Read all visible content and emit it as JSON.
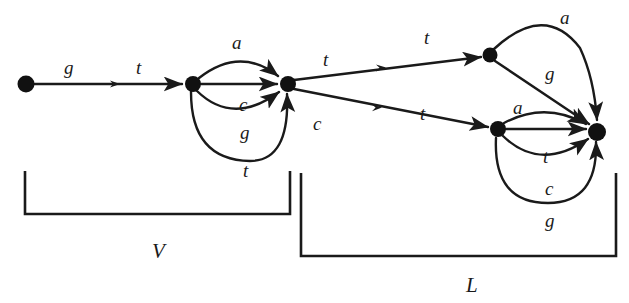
{
  "figure": {
    "type": "directed-graph",
    "alphabet": [
      "a",
      "c",
      "g",
      "t"
    ]
  },
  "nodes": [
    {
      "id": "n0",
      "x": 26,
      "y": 84,
      "r": 8.5
    },
    {
      "id": "n1",
      "x": 193,
      "y": 84,
      "r": 8.0
    },
    {
      "id": "n2",
      "x": 288,
      "y": 84,
      "r": 8.0
    },
    {
      "id": "n3",
      "x": 490,
      "y": 55,
      "r": 7.5
    },
    {
      "id": "n4",
      "x": 498,
      "y": 129,
      "r": 8.0
    },
    {
      "id": "n5",
      "x": 597,
      "y": 132,
      "r": 9.0
    }
  ],
  "edges": [
    {
      "id": "e0",
      "from": "n0",
      "to": "n1",
      "labels": [
        "g",
        "t"
      ]
    },
    {
      "id": "e1",
      "from": "n1",
      "to": "n2",
      "label": "a",
      "shape": "arc-up"
    },
    {
      "id": "e2",
      "from": "n1",
      "to": "n2",
      "label": "",
      "shape": "straight"
    },
    {
      "id": "e3",
      "from": "n1",
      "to": "n2",
      "label": "c",
      "shape": "arc-down-shallow"
    },
    {
      "id": "e4",
      "from": "n1",
      "to": "n2",
      "label": "g",
      "shape": "arc-down-deep"
    },
    {
      "id": "e5",
      "from": "n1",
      "to": "n2",
      "label": "t",
      "shape": "arc-down-deepest"
    },
    {
      "id": "e6",
      "from": "n2",
      "to": "n3",
      "label": "t",
      "shape": "fork-up"
    },
    {
      "id": "e7",
      "from": "n2",
      "to": "n4",
      "label": "c",
      "shape": "fork-down"
    },
    {
      "id": "e8",
      "from": "n3",
      "to": "n5",
      "label": "a",
      "shape": "arc-up"
    },
    {
      "id": "e9",
      "from": "n3",
      "to": "n5",
      "label": "g",
      "shape": "straight"
    },
    {
      "id": "e10",
      "from": "n4",
      "to": "n5",
      "label": "a",
      "shape": "arc-up"
    },
    {
      "id": "e11",
      "from": "n4",
      "to": "n5",
      "label": "",
      "shape": "straight"
    },
    {
      "id": "e12",
      "from": "n4",
      "to": "n5",
      "label": "t",
      "shape": "arc-down-shallow"
    },
    {
      "id": "e13",
      "from": "n4",
      "to": "n5",
      "label": "c",
      "shape": "arc-down-deep"
    },
    {
      "id": "e14",
      "from": "n4",
      "to": "n5",
      "label": "g",
      "shape": "arc-down-deepest"
    }
  ],
  "edge_labels": [
    {
      "id": "lab-g-0",
      "text": "g",
      "x": 64,
      "y": 58
    },
    {
      "id": "lab-t-0",
      "text": "t",
      "x": 136,
      "y": 58
    },
    {
      "id": "lab-a-1",
      "text": "a",
      "x": 232,
      "y": 33
    },
    {
      "id": "lab-c-1",
      "text": "c",
      "x": 239,
      "y": 95
    },
    {
      "id": "lab-g-1",
      "text": "g",
      "x": 240,
      "y": 123
    },
    {
      "id": "lab-t-1",
      "text": "t",
      "x": 243,
      "y": 161
    },
    {
      "id": "lab-t-2",
      "text": "t",
      "x": 323,
      "y": 50
    },
    {
      "id": "lab-c-2",
      "text": "c",
      "x": 313,
      "y": 114
    },
    {
      "id": "lab-t-3",
      "text": "t",
      "x": 424,
      "y": 28
    },
    {
      "id": "lab-t-4",
      "text": "t",
      "x": 420,
      "y": 104
    },
    {
      "id": "lab-a-2",
      "text": "a",
      "x": 560,
      "y": 8
    },
    {
      "id": "lab-g-2",
      "text": "g",
      "x": 545,
      "y": 64
    },
    {
      "id": "lab-a-3",
      "text": "a",
      "x": 513,
      "y": 98
    },
    {
      "id": "lab-t-5",
      "text": "t",
      "x": 543,
      "y": 147
    },
    {
      "id": "lab-c-3",
      "text": "c",
      "x": 545,
      "y": 179
    },
    {
      "id": "lab-g-3",
      "text": "g",
      "x": 545,
      "y": 211
    }
  ],
  "brackets": [
    {
      "id": "bracket-v",
      "label": "V",
      "x1": 25,
      "x2": 290,
      "top": 171,
      "bottom": 214,
      "label_x": 152,
      "label_y": 241
    },
    {
      "id": "bracket-l",
      "label": "L",
      "x1": 301,
      "x2": 616,
      "top": 173,
      "bottom": 256,
      "label_x": 466,
      "label_y": 275
    }
  ],
  "colors": {
    "ink": "#1a1a1a",
    "node_fill": "#111111",
    "background": "#ffffff"
  }
}
